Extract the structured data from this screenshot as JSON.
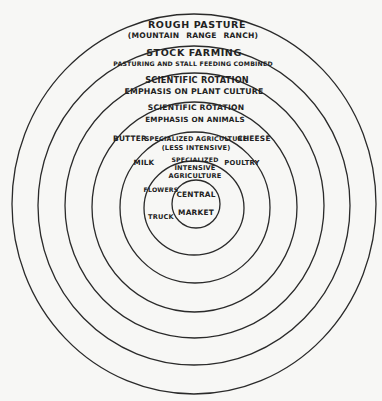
{
  "diagram": {
    "stroke_color": "#2a2a2a",
    "background_color": "#f7f7f5",
    "rings": [
      {
        "name": "rough-pasture",
        "cx": 194,
        "cy": 204,
        "rx": 182,
        "ry": 190
      },
      {
        "name": "stock-farming",
        "cx": 194,
        "cy": 205.5,
        "rx": 156,
        "ry": 159.5
      },
      {
        "name": "scientific-rotation-plant",
        "cx": 194.5,
        "cy": 205.5,
        "rx": 129.5,
        "ry": 132.5
      },
      {
        "name": "scientific-rotation-animals",
        "cx": 194.5,
        "cy": 207,
        "rx": 102.5,
        "ry": 105
      },
      {
        "name": "specialized-less-intensive",
        "cx": 195,
        "cy": 207.5,
        "rx": 75,
        "ry": 75.5
      },
      {
        "name": "specialized-intensive",
        "cx": 194,
        "cy": 208,
        "rx": 50,
        "ry": 47
      },
      {
        "name": "central-market",
        "cx": 196,
        "cy": 204,
        "rx": 24,
        "ry": 24
      }
    ],
    "zones": {
      "rough_pasture": {
        "title": "ROUGH PASTURE",
        "subtitle": "(MOUNTAIN RANGE RANCH)"
      },
      "stock_farming": {
        "title": "STOCK FARMING",
        "subtitle": "PASTURING AND STALL FEEDING COMBINED"
      },
      "scientific_rotation_plant": {
        "title": "SCIENTIFIC ROTATION",
        "subtitle": "EMPHASIS ON PLANT CULTURE"
      },
      "scientific_rotation_animals": {
        "title": "SCIENTIFIC ROTATION",
        "subtitle": "EMPHASIS ON ANIMALS"
      },
      "specialized_less_intensive": {
        "title": "SPECIALIZED AGRICULTURE",
        "subtitle": "(LESS INTENSIVE)",
        "products": [
          "BUTTER",
          "CHEESE",
          "MILK",
          "POULTRY"
        ]
      },
      "specialized_intensive": {
        "line1": "SPECIALIZED",
        "line2": "INTENSIVE",
        "line3": "AGRICULTURE",
        "products": [
          "FLOWERS",
          "TRUCK"
        ]
      },
      "central_market": {
        "line1": "CENTRAL",
        "line2": "MARKET"
      }
    }
  }
}
